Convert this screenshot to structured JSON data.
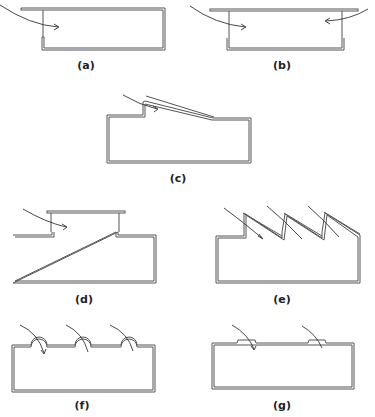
{
  "figure": {
    "panels": [
      {
        "id": "a",
        "label": "(a)",
        "description": "Rectangular room with overhanging flat roof; single sloped-in airflow arrow entering from top-left"
      },
      {
        "id": "b",
        "label": "(b)",
        "description": "Rectangular room with raised flat roof; two airflow arrows entering from left and right clerestory openings"
      },
      {
        "id": "c",
        "label": "(c)",
        "description": "Room with sloped roof monitor; single airflow arrow entering at high-side opening"
      },
      {
        "id": "d",
        "label": "(d)",
        "description": "Room with raised central monitor roof; airflow arrow entering under monitor on left"
      },
      {
        "id": "e",
        "label": "(e)",
        "description": "Sawtooth roof room with three sloped openings, each with airflow arrow"
      },
      {
        "id": "f",
        "label": "(f)",
        "description": "Flat-roof room with three domed roof openings, each with curved airflow arrow"
      },
      {
        "id": "g",
        "label": "(g)",
        "description": "Flat-roof room with two low roof openings, each with airflow arrow"
      }
    ]
  }
}
